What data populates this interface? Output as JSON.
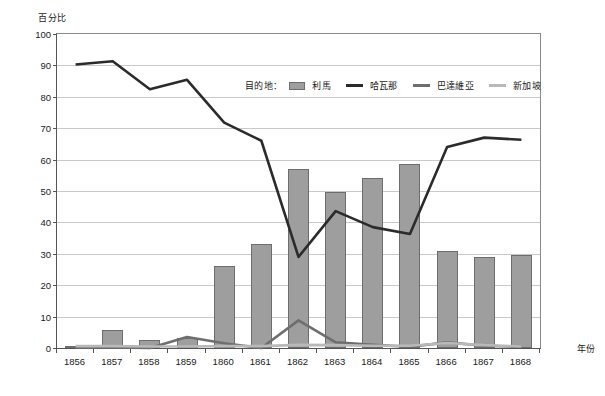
{
  "axes": {
    "y_title": "百分比",
    "x_title": "年份",
    "y_ticks": [
      "0",
      "10",
      "20",
      "30",
      "40",
      "50",
      "60",
      "70",
      "80",
      "90",
      "100"
    ],
    "x_ticks": [
      "1856",
      "1857",
      "1858",
      "1859",
      "1860",
      "1861",
      "1862",
      "1863",
      "1864",
      "1865",
      "1866",
      "1867",
      "1868"
    ]
  },
  "legend": {
    "title": "目的地：",
    "items": [
      {
        "label": "利馬",
        "kind": "bar",
        "color": "#9e9e9e"
      },
      {
        "label": "哈瓦那",
        "kind": "line",
        "color": "#2b2b2b"
      },
      {
        "label": "巴達維亞",
        "kind": "line",
        "color": "#6e6e6e"
      },
      {
        "label": "新加坡",
        "kind": "line",
        "color": "#b9b9b9"
      }
    ]
  },
  "chart_data": {
    "type": "bar",
    "title": "",
    "subtitle": "",
    "xlabel": "年份",
    "ylabel": "百分比",
    "ylim": [
      0,
      100
    ],
    "ytick_step": 10,
    "grid": true,
    "legend_position": "top-center inside plot",
    "categories": [
      "1856",
      "1857",
      "1858",
      "1859",
      "1860",
      "1861",
      "1862",
      "1863",
      "1864",
      "1865",
      "1866",
      "1867",
      "1868"
    ],
    "series": [
      {
        "name": "利馬",
        "type": "bar",
        "color": "#9e9e9e",
        "values": [
          0.5,
          5.7,
          2.6,
          3.3,
          26.0,
          33.2,
          57.0,
          49.8,
          54.2,
          58.5,
          30.8,
          29.0,
          29.6
        ]
      },
      {
        "name": "哈瓦那",
        "type": "line",
        "color": "#2b2b2b",
        "values": [
          90.3,
          91.3,
          82.4,
          85.4,
          71.8,
          66.0,
          29.0,
          43.6,
          38.5,
          36.3,
          64.0,
          67.0,
          66.3
        ]
      },
      {
        "name": "巴達維亞",
        "type": "line",
        "color": "#6e6e6e",
        "values": [
          0.2,
          0.2,
          0.0,
          3.5,
          1.5,
          0.0,
          8.8,
          1.8,
          1.0,
          0.4,
          1.8,
          0.7,
          0.4
        ]
      },
      {
        "name": "新加坡",
        "type": "line",
        "color": "#b9b9b9",
        "values": [
          0.6,
          0.6,
          0.5,
          0.5,
          0.6,
          0.6,
          1.0,
          0.9,
          0.7,
          0.7,
          1.6,
          0.9,
          0.5
        ]
      }
    ]
  }
}
